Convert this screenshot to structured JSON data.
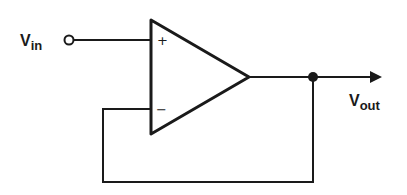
{
  "diagram": {
    "input_label": {
      "main": "V",
      "sub": "in"
    },
    "output_label": {
      "main": "V",
      "sub": "out"
    },
    "opamp": {
      "noninverting_sign": "+",
      "inverting_sign": "−"
    },
    "colors": {
      "line": "#1a1a1a",
      "background": "#ffffff"
    }
  }
}
